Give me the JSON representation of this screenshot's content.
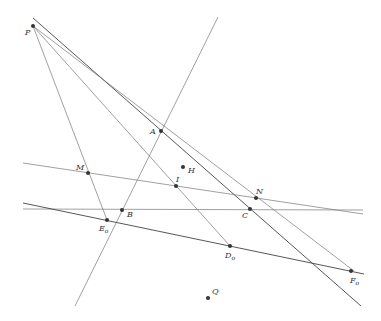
{
  "diagram": {
    "type": "geometric-construction",
    "colors": {
      "line": "#777777",
      "line_dark": "#444444",
      "point": "#333333",
      "label": "#333333"
    },
    "points": [
      {
        "name": "P",
        "label": "P",
        "sub": "",
        "x": 33,
        "y": 26,
        "lx": 25,
        "ly": 35
      },
      {
        "name": "A",
        "label": "A",
        "sub": "",
        "x": 161,
        "y": 131,
        "lx": 150,
        "ly": 134
      },
      {
        "name": "H",
        "label": "H",
        "sub": "",
        "x": 183,
        "y": 167,
        "lx": 188,
        "ly": 173
      },
      {
        "name": "I",
        "label": "I",
        "sub": "",
        "x": 176,
        "y": 186,
        "lx": 176,
        "ly": 182
      },
      {
        "name": "M",
        "label": "M",
        "sub": "",
        "x": 88,
        "y": 173,
        "lx": 76,
        "ly": 170
      },
      {
        "name": "N",
        "label": "N",
        "sub": "",
        "x": 256,
        "y": 198,
        "lx": 256,
        "ly": 194
      },
      {
        "name": "B",
        "label": "B",
        "sub": "",
        "x": 122,
        "y": 210,
        "lx": 127,
        "ly": 217
      },
      {
        "name": "C",
        "label": "C",
        "sub": "",
        "x": 250,
        "y": 209,
        "lx": 242,
        "ly": 218
      },
      {
        "name": "E",
        "label": "E",
        "sub": "o",
        "x": 107,
        "y": 220,
        "lx": 99,
        "ly": 231
      },
      {
        "name": "D",
        "label": "D",
        "sub": "o",
        "x": 230,
        "y": 246,
        "lx": 225,
        "ly": 258
      },
      {
        "name": "F",
        "label": "F",
        "sub": "o",
        "x": 351,
        "y": 271,
        "lx": 350,
        "ly": 283
      },
      {
        "name": "Q",
        "label": "Q",
        "sub": "",
        "x": 208,
        "y": 298,
        "lx": 212,
        "ly": 294
      }
    ],
    "lines": [
      {
        "name": "line-AB",
        "x1": 218,
        "y1": 17,
        "x2": 75,
        "y2": 306,
        "dark": false
      },
      {
        "name": "line-P-top-to-C",
        "x1": 33,
        "y1": 18,
        "x2": 361,
        "y2": 306,
        "dark": true
      },
      {
        "name": "line-PA-N-F",
        "x1": 33,
        "y1": 26,
        "x2": 354,
        "y2": 271,
        "dark": false
      },
      {
        "name": "line-PE",
        "x1": 33,
        "y1": 26,
        "x2": 107,
        "y2": 220,
        "dark": false
      },
      {
        "name": "line-PD",
        "x1": 33,
        "y1": 26,
        "x2": 230,
        "y2": 246,
        "dark": false
      },
      {
        "name": "line-MN",
        "x1": 23,
        "y1": 163,
        "x2": 363,
        "y2": 214,
        "dark": false
      },
      {
        "name": "line-BC",
        "x1": 23,
        "y1": 209,
        "x2": 363,
        "y2": 210,
        "dark": false
      },
      {
        "name": "line-EF",
        "x1": 23,
        "y1": 203,
        "x2": 364,
        "y2": 274,
        "dark": true
      }
    ]
  }
}
